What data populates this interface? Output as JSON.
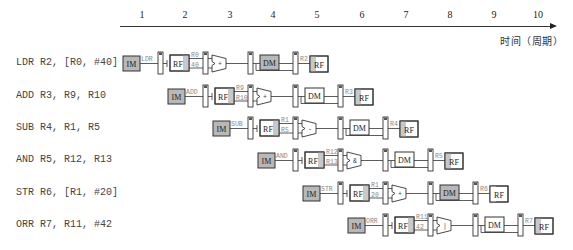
{
  "axis": {
    "ticks": [
      "1",
      "2",
      "3",
      "4",
      "5",
      "6",
      "7",
      "8",
      "9",
      "10"
    ],
    "tick_x": [
      142,
      185,
      230,
      273,
      317,
      362,
      406,
      450,
      494,
      538
    ],
    "label": "时间（周期）"
  },
  "stages": {
    "im": "IM",
    "rf": "RF",
    "dm": "DM",
    "alu_ops": [
      "+",
      "+",
      "-",
      "&",
      "+",
      "|"
    ]
  },
  "instructions": [
    {
      "text": "LDR R2, [R0, #40]",
      "op": "LDR",
      "src1": "R0",
      "src2": "40",
      "dst": "R2",
      "dm_active": true,
      "wb_active": true
    },
    {
      "text": "ADD R3, R9, R10",
      "op": "ADD",
      "src1": "R9",
      "src2": "R10",
      "dst": "R3",
      "dm_active": false,
      "wb_active": true
    },
    {
      "text": "SUB R4, R1, R5",
      "op": "SUB",
      "src1": "R1",
      "src2": "R5",
      "dst": "R4",
      "dm_active": false,
      "wb_active": true
    },
    {
      "text": "AND R5, R12, R13",
      "op": "AND",
      "src1": "R12",
      "src2": "R13",
      "dst": "R5",
      "dm_active": false,
      "wb_active": true
    },
    {
      "text": "STR R6, [R1, #20]",
      "op": "STR",
      "src1": "R1",
      "src2": "20",
      "dst": "R6",
      "dm_active": true,
      "wb_active": false
    },
    {
      "text": "ORR R7, R11, #42",
      "op": "ORR",
      "src1": "R11",
      "src2": "42",
      "dst": "R7",
      "dm_active": false,
      "wb_active": true
    }
  ],
  "colors": {
    "active_fill": "#b8b8b8",
    "stroke": "#333333",
    "label_gray": "#888888"
  }
}
